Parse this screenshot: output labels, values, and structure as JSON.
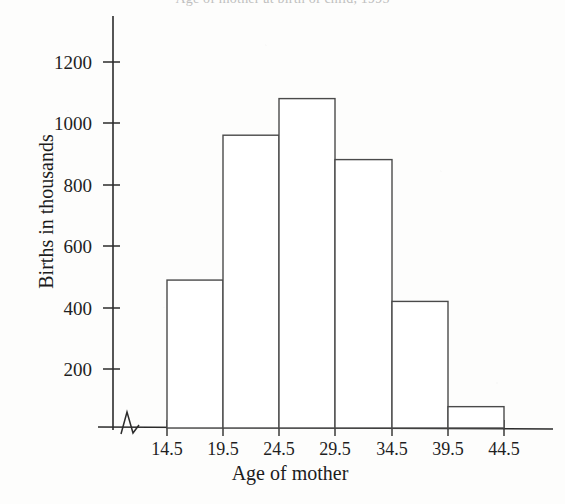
{
  "chart_data": {
    "type": "bar",
    "title": "Age of mother at birth of child, 1995",
    "title_note": "title is cropped off at the top edge of the screenshot and is largely illegible",
    "xlabel": "Age of mother",
    "ylabel": "Births in thousands",
    "categories": [
      "14.5-19.5",
      "19.5-24.5",
      "24.5-29.5",
      "29.5-34.5",
      "34.5-39.5",
      "39.5-44.5"
    ],
    "bin_edges": [
      "14.5",
      "19.5",
      "24.5",
      "29.5",
      "34.5",
      "39.5",
      "44.5"
    ],
    "values": [
      485,
      960,
      1080,
      880,
      415,
      70
    ],
    "xtick_labels": [
      "14.5",
      "19.5",
      "24.5",
      "29.5",
      "34.5",
      "39.5",
      "44.5"
    ],
    "ytick_labels": [
      "200",
      "400",
      "600",
      "800",
      "1000",
      "1200"
    ],
    "ytick_values": [
      200,
      400,
      600,
      800,
      1000,
      1200
    ],
    "ylim": [
      0,
      1280
    ],
    "grid": false,
    "legend": false,
    "axis_break": true,
    "axis_break_symbol": "zigzag",
    "bar_fill": "#ffffff",
    "bar_stroke": "#4a4a4a",
    "axis_color": "#2b2b2b",
    "background": "#fdfdfc",
    "text_color": "#1c1c1c"
  }
}
